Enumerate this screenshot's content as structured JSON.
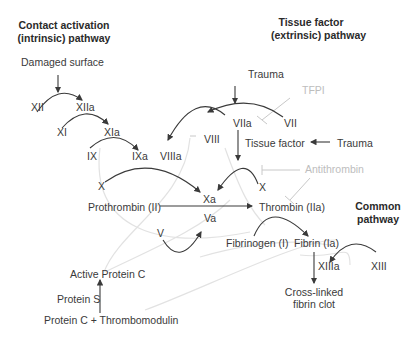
{
  "titles": {
    "intrinsic_line1": "Contact activation",
    "intrinsic_line2": "(intrinsic) pathway",
    "extrinsic_line1": "Tissue factor",
    "extrinsic_line2": "(extrinsic) pathway",
    "common_line1": "Common",
    "common_line2": "pathway"
  },
  "nodes": {
    "damaged_surface": "Damaged surface",
    "xii": "XII",
    "xiia": "XIIa",
    "xi": "XI",
    "xia": "XIa",
    "ix": "IX",
    "ixa": "IXa",
    "viiia": "VIIIa",
    "viii": "VIII",
    "x_left": "X",
    "xa": "Xa",
    "va": "Va",
    "v": "V",
    "prothrombin": "Prothrombin (II)",
    "thrombin": "Thrombin (IIa)",
    "trauma_top": "Trauma",
    "tfpi": "TFPI",
    "viia": "VIIa",
    "vii": "VII",
    "tissue_factor": "Tissue factor",
    "trauma_right": "Trauma",
    "antithrombin": "Antithrombin",
    "x_right": "X",
    "fibrinogen": "Fibrinogen (I)",
    "fibrin": "Fibrin (Ia)",
    "xiiia": "XIIIa",
    "xiii": "XIII",
    "clot_line1": "Cross-linked",
    "clot_line2": "fibrin clot",
    "active_protein_c": "Active Protein C",
    "protein_s": "Protein S",
    "protein_c_thrombomodulin": "Protein C + Thrombomodulin"
  },
  "colors": {
    "arrow": "#3a3a3a",
    "inhibitor": "#c8c8c8",
    "feedback": "#dcdcdc"
  }
}
